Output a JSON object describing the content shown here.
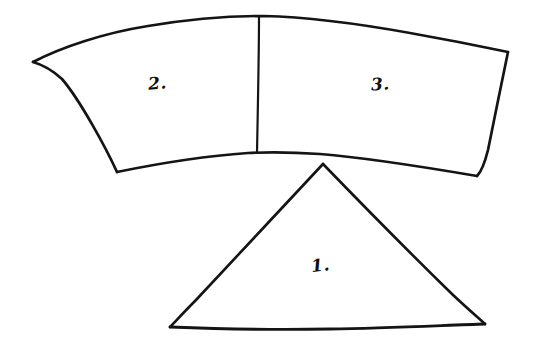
{
  "drawing": {
    "title": "Hand-drawn sketch of a curved band split into two regions above a triangle",
    "medium": "pen on white paper",
    "background_color": "#ffffff",
    "ink_color": "#141414",
    "canvas": {
      "width": 540,
      "height": 353
    }
  },
  "shapes": [
    {
      "id": "curved-band",
      "name": "curved band",
      "kind": "annulus-sector",
      "description": "Wide arc-shaped band spanning the top of the page, curving upward in the middle, divided by a vertical line into two regions",
      "corners": {
        "top_left": [
          33,
          62
        ],
        "top_right": [
          508,
          52
        ],
        "bottom_right": [
          477,
          176
        ],
        "bottom_left": [
          117,
          172
        ]
      },
      "top_edge_peak": [
        280,
        16
      ],
      "bottom_edge_peak": [
        262,
        153
      ],
      "stroke_width": 2.6
    },
    {
      "id": "band-divider",
      "name": "divider line",
      "kind": "line",
      "description": "Vertical line splitting the curved band into region 2 (left) and region 3 (right)",
      "from": [
        259,
        17
      ],
      "to": [
        257,
        153
      ],
      "stroke_width": 2.2
    },
    {
      "id": "triangle",
      "name": "triangle",
      "kind": "triangle",
      "description": "Isosceles triangle below the band, apex pointing up toward the band's lower edge",
      "apex": [
        323,
        164
      ],
      "bottom_left": [
        170,
        327
      ],
      "bottom_right": [
        485,
        324
      ],
      "stroke_width": 2.6
    }
  ],
  "labels": [
    {
      "id": "label-1",
      "text": "1.",
      "belongs_to": "triangle",
      "position": [
        323,
        265
      ]
    },
    {
      "id": "label-2",
      "text": "2.",
      "belongs_to": "curved-band-left-region",
      "position": [
        160,
        84
      ]
    },
    {
      "id": "label-3",
      "text": "3.",
      "belongs_to": "curved-band-right-region",
      "position": [
        382,
        85
      ]
    }
  ]
}
